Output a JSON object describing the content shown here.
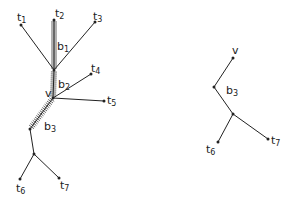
{
  "figure": {
    "left_tree": {
      "nodes": {
        "t1": {
          "x": 21,
          "y": 25,
          "label": "t",
          "sub": "1"
        },
        "t2": {
          "x": 54,
          "y": 20,
          "label": "t",
          "sub": "2"
        },
        "t3": {
          "x": 95,
          "y": 22,
          "label": "t",
          "sub": "3"
        },
        "j1": {
          "x": 54,
          "y": 70
        },
        "t4": {
          "x": 91,
          "y": 74,
          "label": "t",
          "sub": "4"
        },
        "v": {
          "x": 53,
          "y": 98,
          "label": "v"
        },
        "t5": {
          "x": 104,
          "y": 101,
          "label": "t",
          "sub": "5"
        },
        "j2": {
          "x": 30,
          "y": 129
        },
        "j3": {
          "x": 34,
          "y": 154
        },
        "t6": {
          "x": 20,
          "y": 179,
          "label": "t",
          "sub": "6"
        },
        "t7": {
          "x": 59,
          "y": 178,
          "label": "t",
          "sub": "7"
        }
      },
      "hatched_edges": [
        {
          "from": "t2",
          "to": "j1",
          "label": "b",
          "sub": "1"
        },
        {
          "from": "j1",
          "to": "v",
          "label": "b",
          "sub": "2"
        },
        {
          "from": "v",
          "to": "j2",
          "label": "b",
          "sub": "3"
        }
      ],
      "edges": [
        [
          "t1",
          "j1"
        ],
        [
          "t3",
          "j1"
        ],
        [
          "t4",
          "v"
        ],
        [
          "t5",
          "v"
        ],
        [
          "j2",
          "j3"
        ],
        [
          "j3",
          "t6"
        ],
        [
          "j3",
          "t7"
        ]
      ]
    },
    "right_tree": {
      "nodes": {
        "v": {
          "x": 233,
          "y": 58,
          "label": "v"
        },
        "j2": {
          "x": 214,
          "y": 87
        },
        "j3": {
          "x": 233,
          "y": 114
        },
        "t6": {
          "x": 218,
          "y": 142,
          "label": "t",
          "sub": "6"
        },
        "t7": {
          "x": 268,
          "y": 139,
          "label": "t",
          "sub": "7"
        }
      },
      "edge_label": {
        "label": "b",
        "sub": "3"
      },
      "edges": [
        [
          "v",
          "j2"
        ],
        [
          "j2",
          "j3"
        ],
        [
          "j3",
          "t6"
        ],
        [
          "j3",
          "t7"
        ]
      ]
    },
    "labels": {
      "t1": "t1",
      "t2": "t2",
      "t3": "t3",
      "t4": "t4",
      "t5": "t5",
      "t6": "t6",
      "t7": "t7",
      "v": "v",
      "b1": "b1",
      "b2": "b2",
      "b3": "b3"
    }
  }
}
